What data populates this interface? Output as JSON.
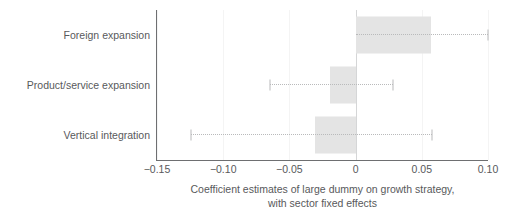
{
  "chart_data": {
    "type": "bar",
    "orientation": "horizontal",
    "title": "",
    "xlabel": "Coefficient estimates of large dummy on growth strategy, with sector fixed effects",
    "xlabel_line1": "Coefficient estimates of large dummy on growth strategy,",
    "xlabel_line2": "with sector fixed effects",
    "ylabel": "",
    "categories": [
      "Foreign expansion",
      "Product/service expansion",
      "Vertical integration"
    ],
    "values": [
      0.057,
      -0.019,
      -0.031
    ],
    "ci_low": [
      0.0,
      -0.065,
      -0.124
    ],
    "ci_high": [
      0.1,
      0.028,
      0.058
    ],
    "xlim": [
      -0.15,
      0.1
    ],
    "xticks": [
      -0.15,
      -0.1,
      -0.05,
      0,
      0.05,
      0.1
    ],
    "xticklabels": [
      "−0.15",
      "−0.10",
      "−0.05",
      "0",
      "0.05",
      "0.10"
    ],
    "grid": true,
    "grid_axis": "x",
    "legend": false,
    "legend_position": "none",
    "zero_reference_line": 0,
    "bar_color": "#e4e4e4",
    "error_color": "#b9babb",
    "axis_color": "#6e6f71",
    "text_color": "#58595b",
    "gridline_color": "#f4f4f4",
    "background": "#ffffff"
  }
}
